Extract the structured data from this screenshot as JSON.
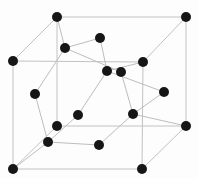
{
  "diagram": {
    "kind": "crystal-lattice-cube",
    "canvas": {
      "width": 198,
      "height": 179
    },
    "colors": {
      "background": "#fdfdfd",
      "atom_fill": "#161616",
      "edge_line": "#c2c2c2",
      "bond_line": "#bdbdbd"
    },
    "atom_radius": 5,
    "atoms": [
      {
        "id": "corner-back-top-left",
        "x": 57,
        "y": 17
      },
      {
        "id": "corner-back-top-right",
        "x": 186,
        "y": 17
      },
      {
        "id": "corner-front-top-left",
        "x": 13,
        "y": 61
      },
      {
        "id": "corner-front-top-right",
        "x": 143,
        "y": 62
      },
      {
        "id": "corner-back-bottom-left",
        "x": 57,
        "y": 126
      },
      {
        "id": "corner-back-bottom-right",
        "x": 186,
        "y": 126
      },
      {
        "id": "corner-front-bottom-left",
        "x": 13,
        "y": 169
      },
      {
        "id": "corner-front-bottom-right",
        "x": 142,
        "y": 169
      },
      {
        "id": "face-center-top",
        "x": 100,
        "y": 38
      },
      {
        "id": "face-center-back",
        "x": 121,
        "y": 72
      },
      {
        "id": "face-center-left",
        "x": 35,
        "y": 94
      },
      {
        "id": "face-center-right",
        "x": 164,
        "y": 92
      },
      {
        "id": "face-center-front",
        "x": 78,
        "y": 115
      },
      {
        "id": "face-center-bottom",
        "x": 99,
        "y": 145
      },
      {
        "id": "interior-top-left",
        "x": 65,
        "y": 48
      },
      {
        "id": "interior-top-right",
        "x": 107,
        "y": 71
      },
      {
        "id": "interior-bottom-right",
        "x": 133,
        "y": 114
      },
      {
        "id": "interior-bottom-left",
        "x": 48,
        "y": 142
      }
    ],
    "cube_edges": [
      [
        "corner-back-top-left",
        "corner-back-top-right"
      ],
      [
        "corner-front-top-left",
        "corner-front-top-right"
      ],
      [
        "corner-back-top-left",
        "corner-front-top-left"
      ],
      [
        "corner-back-top-right",
        "corner-front-top-right"
      ],
      [
        "corner-front-top-left",
        "corner-front-bottom-left"
      ],
      [
        "corner-back-top-left",
        "corner-back-bottom-left"
      ],
      [
        "corner-back-top-right",
        "corner-back-bottom-right"
      ],
      [
        "corner-front-top-right",
        "corner-front-bottom-right"
      ],
      [
        "corner-front-bottom-left",
        "corner-front-bottom-right"
      ],
      [
        "corner-back-bottom-left",
        "corner-back-bottom-right"
      ],
      [
        "corner-front-bottom-left",
        "corner-back-bottom-left"
      ],
      [
        "corner-front-bottom-right",
        "corner-back-bottom-right"
      ]
    ],
    "bonds": [
      [
        "interior-top-left",
        "corner-back-top-left"
      ],
      [
        "interior-top-left",
        "face-center-top"
      ],
      [
        "interior-top-left",
        "face-center-left"
      ],
      [
        "interior-top-left",
        "face-center-back"
      ],
      [
        "interior-top-right",
        "corner-front-top-right"
      ],
      [
        "interior-top-right",
        "face-center-top"
      ],
      [
        "interior-top-right",
        "face-center-front"
      ],
      [
        "interior-top-right",
        "face-center-right"
      ],
      [
        "interior-bottom-right",
        "corner-back-bottom-right"
      ],
      [
        "interior-bottom-right",
        "face-center-back"
      ],
      [
        "interior-bottom-right",
        "face-center-bottom"
      ],
      [
        "interior-bottom-right",
        "face-center-right"
      ],
      [
        "interior-bottom-left",
        "corner-front-bottom-left"
      ],
      [
        "interior-bottom-left",
        "face-center-left"
      ],
      [
        "interior-bottom-left",
        "face-center-front"
      ],
      [
        "interior-bottom-left",
        "face-center-bottom"
      ]
    ]
  }
}
